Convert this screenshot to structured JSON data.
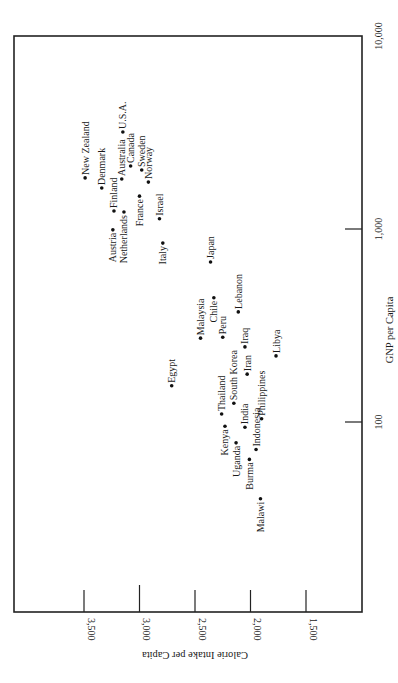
{
  "chart_data": {
    "type": "scatter",
    "title": "",
    "orientation": "rotated 90° counter-clockwise (page printed sideways)",
    "xlabel": "GNP per Capita",
    "ylabel": "Calorie Intake per Capita",
    "x_scale": "log",
    "xlim": [
      30,
      10000
    ],
    "ylim": [
      1250,
      4130
    ],
    "x_ticks": [
      {
        "value": 100,
        "label": "100"
      },
      {
        "value": 1000,
        "label": "1,000"
      },
      {
        "value": 10000,
        "label": "10,000"
      }
    ],
    "y_ticks": [
      {
        "value": 3500,
        "label": "3,500"
      },
      {
        "value": 3000,
        "label": "3,000"
      },
      {
        "value": 2500,
        "label": "2,500"
      },
      {
        "value": 2000,
        "label": "2,000"
      },
      {
        "value": 1500,
        "label": "1,500"
      }
    ],
    "grid": false,
    "legend": null,
    "points": [
      {
        "label": "New Zealand",
        "gnp": 1840,
        "calories": 3490,
        "label_side": "right"
      },
      {
        "label": "Denmark",
        "gnp": 1630,
        "calories": 3340,
        "label_side": "right"
      },
      {
        "label": "U.S.A.",
        "gnp": 3180,
        "calories": 3150,
        "label_side": "right"
      },
      {
        "label": "Australia",
        "gnp": 1815,
        "calories": 3160,
        "label_side": "right"
      },
      {
        "label": "Canada",
        "gnp": 2120,
        "calories": 3080,
        "label_side": "right"
      },
      {
        "label": "Sweden",
        "gnp": 2020,
        "calories": 2980,
        "label_side": "right"
      },
      {
        "label": "Norway",
        "gnp": 1750,
        "calories": 2920,
        "label_side": "right"
      },
      {
        "label": "Finland",
        "gnp": 1240,
        "calories": 3230,
        "label_side": "right"
      },
      {
        "label": "Austria",
        "gnp": 990,
        "calories": 3240,
        "label_side": "left"
      },
      {
        "label": "Netherlands",
        "gnp": 1225,
        "calories": 3140,
        "label_side": "left"
      },
      {
        "label": "France",
        "gnp": 1480,
        "calories": 3000,
        "label_side": "left"
      },
      {
        "label": "Israel",
        "gnp": 1130,
        "calories": 2820,
        "label_side": "right"
      },
      {
        "label": "Italy",
        "gnp": 845,
        "calories": 2790,
        "label_side": "left"
      },
      {
        "label": "Japan",
        "gnp": 675,
        "calories": 2360,
        "label_side": "right"
      },
      {
        "label": "Chile",
        "gnp": 440,
        "calories": 2330,
        "label_side": "left"
      },
      {
        "label": "Malaysia",
        "gnp": 272,
        "calories": 2450,
        "label_side": "right"
      },
      {
        "label": "Lebanon",
        "gnp": 372,
        "calories": 2110,
        "label_side": "right"
      },
      {
        "label": "Peru",
        "gnp": 275,
        "calories": 2250,
        "label_side": "right"
      },
      {
        "label": "Iraq",
        "gnp": 245,
        "calories": 2050,
        "label_side": "right"
      },
      {
        "label": "Libya",
        "gnp": 220,
        "calories": 1770,
        "label_side": "right"
      },
      {
        "label": "Egypt",
        "gnp": 154,
        "calories": 2710,
        "label_side": "right"
      },
      {
        "label": "Iran",
        "gnp": 177,
        "calories": 2030,
        "label_side": "right"
      },
      {
        "label": "South Korea",
        "gnp": 125,
        "calories": 2150,
        "label_side": "right"
      },
      {
        "label": "Thailand",
        "gnp": 110,
        "calories": 2260,
        "label_side": "right"
      },
      {
        "label": "Philippines",
        "gnp": 104,
        "calories": 1900,
        "label_side": "right"
      },
      {
        "label": "India",
        "gnp": 94,
        "calories": 2050,
        "label_side": "right"
      },
      {
        "label": "Kenya",
        "gnp": 95,
        "calories": 2230,
        "label_side": "left"
      },
      {
        "label": "Uganda",
        "gnp": 78,
        "calories": 2130,
        "label_side": "left"
      },
      {
        "label": "Indonesia",
        "gnp": 72,
        "calories": 1950,
        "label_side": "right"
      },
      {
        "label": "Burma",
        "gnp": 64,
        "calories": 2010,
        "label_side": "left"
      },
      {
        "label": "Malawi",
        "gnp": 40,
        "calories": 1910,
        "label_side": "left"
      }
    ]
  },
  "colors": {
    "ink": "#1a1a1a",
    "background": "#ffffff"
  }
}
